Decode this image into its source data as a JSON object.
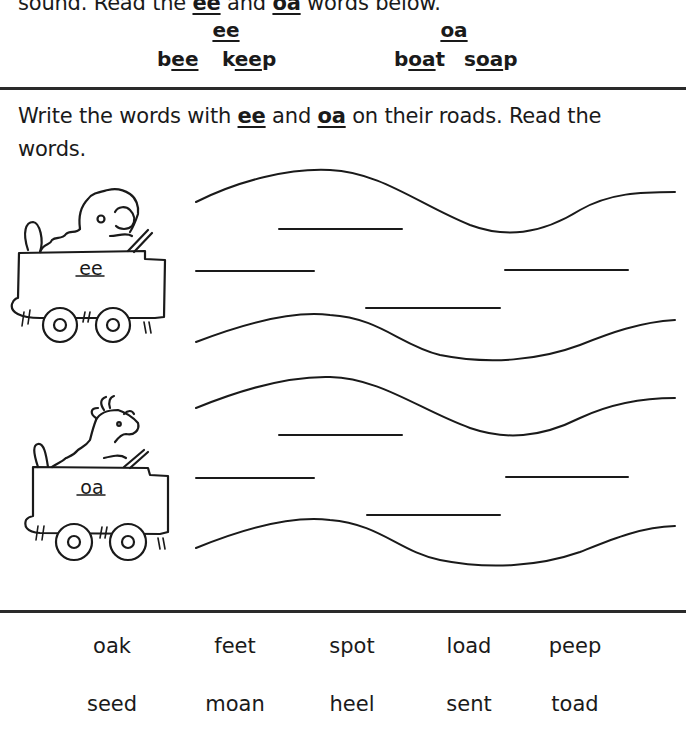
{
  "intro": {
    "text_before": "sound. Read the ",
    "ee": "ee",
    "text_mid": " and ",
    "oa": "oa",
    "text_after": " words below."
  },
  "examples": {
    "ee": {
      "heading": "ee",
      "words": [
        {
          "pre": "b",
          "pattern": "ee",
          "post": ""
        },
        {
          "pre": "k",
          "pattern": "ee",
          "post": "p"
        }
      ]
    },
    "oa": {
      "heading": "oa",
      "words": [
        {
          "pre": "b",
          "pattern": "oa",
          "post": "t"
        },
        {
          "pre": "s",
          "pattern": "oa",
          "post": "p"
        }
      ]
    }
  },
  "instruction": {
    "text_before": "Write the words with ",
    "ee": "ee",
    "text_mid": " and ",
    "oa": "oa",
    "text_after": " on their roads. Read the words."
  },
  "roads": [
    {
      "label": "ee",
      "driver": "poodle",
      "blank_count": 5
    },
    {
      "label": "oa",
      "driver": "goat",
      "blank_count": 5
    }
  ],
  "word_bank": {
    "rows": [
      [
        "oak",
        "feet",
        "spot",
        "load",
        "peep"
      ],
      [
        "seed",
        "moan",
        "heel",
        "sent",
        "toad"
      ]
    ]
  }
}
